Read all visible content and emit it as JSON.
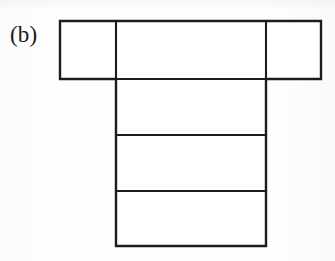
{
  "figure": {
    "panel_label": "(b)",
    "caption": "",
    "canvas": {
      "width": 335,
      "height": 261
    },
    "style": {
      "background_color": "#fefefe",
      "stroke_color": "#1c1c1c",
      "fill_color": "#ffffff",
      "stroke_width": 2.2
    },
    "geometry": {
      "top_bar": {
        "x1": 60,
        "y1": 21,
        "x2": 321,
        "y2": 79
      },
      "stem": {
        "x1": 116,
        "y1": 79,
        "x2": 266,
        "y2": 246
      },
      "vertical_dividers_x": [
        116,
        266
      ],
      "horizontal_dividers_y": [
        135,
        191
      ]
    },
    "cells": [
      {
        "id": "top-left-cell",
        "x": 60,
        "y": 21,
        "width": 56,
        "height": 58,
        "label": ""
      },
      {
        "id": "top-center-cell",
        "x": 116,
        "y": 21,
        "width": 150,
        "height": 58,
        "label": ""
      },
      {
        "id": "top-right-cell",
        "x": 266,
        "y": 21,
        "width": 55,
        "height": 58,
        "label": ""
      },
      {
        "id": "stem-upper-cell",
        "x": 116,
        "y": 79,
        "width": 150,
        "height": 56,
        "label": ""
      },
      {
        "id": "stem-middle-cell",
        "x": 116,
        "y": 135,
        "width": 150,
        "height": 56,
        "label": ""
      },
      {
        "id": "stem-lower-cell",
        "x": 116,
        "y": 191,
        "width": 150,
        "height": 55,
        "label": ""
      }
    ],
    "segments": [
      {
        "id": "outline-path",
        "kind": "outer-boundary"
      },
      {
        "id": "divider-vertical-left",
        "x1": 116,
        "y1": 21,
        "x2": 116,
        "y2": 79
      },
      {
        "id": "divider-vertical-right",
        "x1": 266,
        "y1": 21,
        "x2": 266,
        "y2": 79
      },
      {
        "id": "divider-horizontal-top",
        "x1": 116,
        "y1": 79,
        "x2": 266,
        "y2": 79
      },
      {
        "id": "divider-horizontal-mid",
        "x1": 116,
        "y1": 135,
        "x2": 266,
        "y2": 135
      },
      {
        "id": "divider-horizontal-low",
        "x1": 116,
        "y1": 191,
        "x2": 266,
        "y2": 191
      }
    ]
  }
}
